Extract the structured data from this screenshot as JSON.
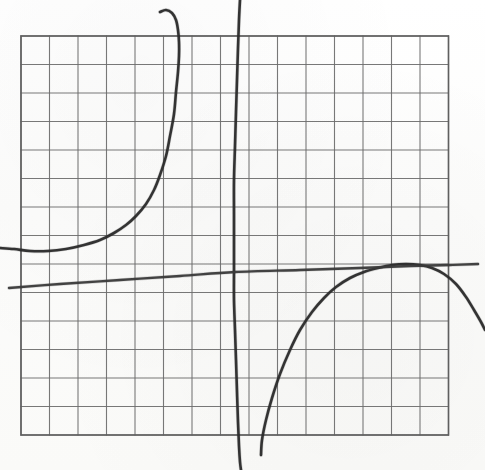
{
  "figure": {
    "kind": "hand-drawn-graph-on-grid-paper",
    "width_px": 485,
    "height_px": 470,
    "background_color": "#fdfdfc",
    "grid_line_color": "#6d6d6d",
    "curve_ink_color": "#2a2a2a"
  },
  "grid": {
    "origin_x_px": 21,
    "origin_y_px": 36,
    "cell_px": 28.5,
    "columns": 15,
    "rows": 14,
    "right_px": 448.5,
    "bottom_px": 435,
    "border_color": "#5f5f5f",
    "line_color": "#6d6d6d",
    "line_width_px": 1.1,
    "border_width_px": 1.6
  },
  "chart_data": {
    "type": "line",
    "title": "",
    "subtitle": "",
    "xlabel": "",
    "ylabel": "",
    "grid": true,
    "legend_position": "none",
    "axis_tick_labels": {
      "x": [],
      "y": []
    },
    "xlim_px": [
      0,
      485
    ],
    "ylim_px": [
      0,
      470
    ],
    "note": "Axes are unlabeled grid paper; values below are traced in pixel coordinates of the 485x470 image (y increases downward).",
    "series": [
      {
        "name": "left-branch",
        "style": "hand-drawn solid",
        "color": "#2a2a2a",
        "stroke_px": 2.6,
        "description": "Rises from a shallow minimum near the left edge then turns steeply upward toward the vertical asymptote, hooking left at the very top.",
        "points_px": [
          [
            0,
            248
          ],
          [
            14,
            249
          ],
          [
            30,
            251
          ],
          [
            48,
            251
          ],
          [
            66,
            249
          ],
          [
            84,
            245
          ],
          [
            100,
            240
          ],
          [
            114,
            233
          ],
          [
            126,
            225
          ],
          [
            136,
            216
          ],
          [
            146,
            204
          ],
          [
            154,
            190
          ],
          [
            160,
            175
          ],
          [
            166,
            156
          ],
          [
            170,
            136
          ],
          [
            174,
            114
          ],
          [
            176,
            92
          ],
          [
            178,
            72
          ],
          [
            179,
            56
          ],
          [
            179,
            42
          ],
          [
            178,
            30
          ],
          [
            176,
            20
          ],
          [
            172,
            13
          ],
          [
            166,
            10
          ],
          [
            160,
            12
          ]
        ]
      },
      {
        "name": "middle-vertical-asymptote-curve",
        "style": "hand-drawn solid",
        "color": "#2a2a2a",
        "stroke_px": 2.6,
        "description": "Near-vertical stroke crossing the whole figure just left of centre, bowing slightly.",
        "points_px": [
          [
            240,
            0
          ],
          [
            239,
            20
          ],
          [
            238,
            48
          ],
          [
            237,
            80
          ],
          [
            236,
            112
          ],
          [
            235,
            146
          ],
          [
            234,
            180
          ],
          [
            234,
            214
          ],
          [
            234,
            248
          ],
          [
            234,
            272
          ],
          [
            234,
            300
          ],
          [
            235,
            330
          ],
          [
            236,
            360
          ],
          [
            237,
            392
          ],
          [
            238,
            422
          ],
          [
            239,
            446
          ],
          [
            240,
            462
          ],
          [
            241,
            470
          ]
        ]
      },
      {
        "name": "right-branch",
        "style": "hand-drawn solid",
        "color": "#2a2a2a",
        "stroke_px": 2.6,
        "description": "Comes up steeply from the bottom near the asymptote, flattens to a broad maximum, then falls away off the right edge.",
        "points_px": [
          [
            261,
            455
          ],
          [
            262,
            440
          ],
          [
            266,
            420
          ],
          [
            272,
            398
          ],
          [
            280,
            374
          ],
          [
            290,
            350
          ],
          [
            300,
            330
          ],
          [
            312,
            312
          ],
          [
            324,
            298
          ],
          [
            336,
            287
          ],
          [
            350,
            278
          ],
          [
            364,
            272
          ],
          [
            378,
            268
          ],
          [
            392,
            265
          ],
          [
            406,
            264
          ],
          [
            420,
            265
          ],
          [
            432,
            268
          ],
          [
            444,
            274
          ],
          [
            456,
            284
          ],
          [
            466,
            297
          ],
          [
            474,
            310
          ],
          [
            481,
            322
          ],
          [
            485,
            330
          ]
        ]
      },
      {
        "name": "slanted-near-horizontal-line",
        "style": "hand-drawn solid",
        "color": "#3a3a3a",
        "stroke_px": 2.4,
        "description": "Long, gently rising nearly straight stroke from the lower left edge to the upper right edge, crossing the asymptote near mid-height.",
        "points_px": [
          [
            9,
            288
          ],
          [
            60,
            284
          ],
          [
            120,
            280
          ],
          [
            180,
            276
          ],
          [
            235,
            272
          ],
          [
            300,
            270
          ],
          [
            360,
            268
          ],
          [
            410,
            266
          ],
          [
            450,
            265
          ],
          [
            478,
            264
          ]
        ]
      }
    ],
    "annotations": []
  },
  "features": {
    "vertical_asymptote_x_px": 236,
    "left_branch_minimum_px": [
      40,
      251
    ],
    "right_branch_maximum_px": [
      400,
      264
    ],
    "crossing_of_line_and_asymptote_px": [
      235,
      272
    ]
  }
}
